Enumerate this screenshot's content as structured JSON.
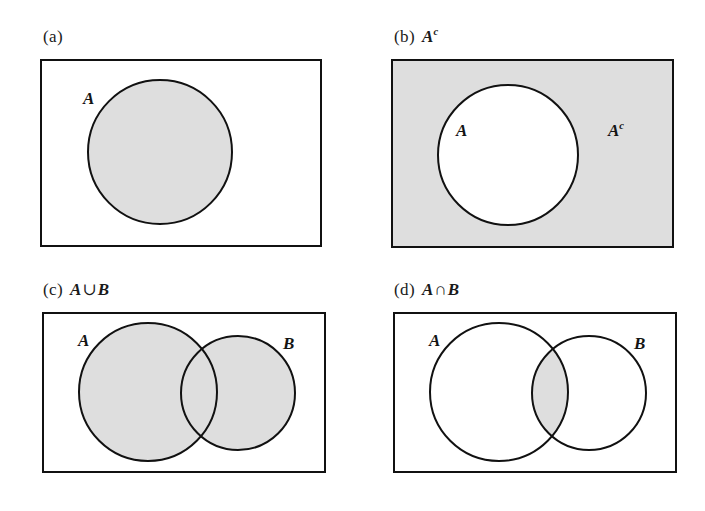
{
  "figure": {
    "background_color": "#ffffff",
    "shade_color": "#dedede",
    "stroke_color": "#111111",
    "width": 705,
    "height": 511
  },
  "panels": [
    {
      "id": "a",
      "enum_label": "(a)",
      "expression": "",
      "expression_parts": {
        "left": "",
        "operator": "",
        "right": "",
        "superscript": ""
      },
      "description": "Set A shaded inside universal rectangle",
      "rect": {
        "x": 41,
        "y": 60,
        "width": 280,
        "height": 186
      },
      "circles": [
        {
          "name": "A",
          "cx": 160,
          "cy": 152,
          "r": 72,
          "filled": true
        }
      ],
      "region_shaded": "A",
      "rect_filled": false,
      "labels": [
        {
          "text": "A",
          "superscript": "",
          "x": 83,
          "y": 90,
          "name": "set-label-a"
        }
      ]
    },
    {
      "id": "b",
      "enum_label": "(b)",
      "expression": "Ac",
      "expression_parts": {
        "left": "A",
        "operator": "",
        "right": "",
        "superscript": "c"
      },
      "description": "Complement of A: everything outside circle A shaded",
      "rect": {
        "x": 392,
        "y": 60,
        "width": 281,
        "height": 187
      },
      "circles": [
        {
          "name": "A",
          "cx": 508,
          "cy": 155,
          "r": 70,
          "filled": false
        }
      ],
      "region_shaded": "complement-of-A",
      "rect_filled": true,
      "labels": [
        {
          "text": "A",
          "superscript": "",
          "x": 456,
          "y": 122,
          "name": "set-label-a"
        },
        {
          "text": "A",
          "superscript": "c",
          "x": 608,
          "y": 122,
          "name": "set-label-a-complement"
        }
      ]
    },
    {
      "id": "c",
      "enum_label": "(c)",
      "expression": "A ∪ B",
      "expression_parts": {
        "left": "A",
        "operator": "∪",
        "right": "B",
        "superscript": ""
      },
      "description": "Union of A and B: both circles shaded",
      "rect": {
        "x": 43,
        "y": 313,
        "width": 282,
        "height": 159
      },
      "circles": [
        {
          "name": "A",
          "cx": 148,
          "cy": 392,
          "r": 69,
          "filled": true
        },
        {
          "name": "B",
          "cx": 238,
          "cy": 393,
          "r": 57,
          "filled": true
        }
      ],
      "region_shaded": "union",
      "rect_filled": false,
      "labels": [
        {
          "text": "A",
          "superscript": "",
          "x": 78,
          "y": 332,
          "name": "set-label-a"
        },
        {
          "text": "B",
          "superscript": "",
          "x": 283,
          "y": 335,
          "name": "set-label-b"
        }
      ]
    },
    {
      "id": "d",
      "enum_label": "(d)",
      "expression": "A ∩ B",
      "expression_parts": {
        "left": "A",
        "operator": "∩",
        "right": "B",
        "superscript": ""
      },
      "description": "Intersection of A and B: only the overlapping lens shaded",
      "rect": {
        "x": 394,
        "y": 313,
        "width": 282,
        "height": 159
      },
      "circles": [
        {
          "name": "A",
          "cx": 499,
          "cy": 392,
          "r": 69,
          "filled": false
        },
        {
          "name": "B",
          "cx": 589,
          "cy": 393,
          "r": 57,
          "filled": false
        }
      ],
      "region_shaded": "intersection",
      "rect_filled": false,
      "labels": [
        {
          "text": "A",
          "superscript": "",
          "x": 429,
          "y": 332,
          "name": "set-label-a"
        },
        {
          "text": "B",
          "superscript": "",
          "x": 634,
          "y": 335,
          "name": "set-label-b"
        }
      ]
    }
  ],
  "captions": {
    "a": {
      "x": 43,
      "y": 28
    },
    "b": {
      "x": 394,
      "y": 28
    },
    "c": {
      "x": 43,
      "y": 281
    },
    "d": {
      "x": 394,
      "y": 281
    }
  }
}
